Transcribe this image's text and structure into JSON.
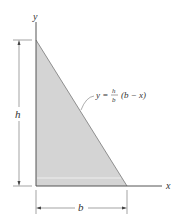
{
  "figure": {
    "axes": {
      "x_label": "x",
      "y_label": "y"
    },
    "dimensions": {
      "height_label": "h",
      "base_label": "b"
    },
    "curve_equation": {
      "lhs": "y =",
      "numerator": "h",
      "denominator": "b",
      "rhs": "(b − x)"
    },
    "colors": {
      "fill": "#d4d4d4",
      "stroke": "#555555"
    }
  }
}
